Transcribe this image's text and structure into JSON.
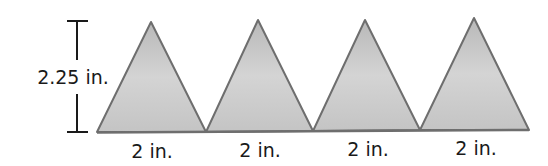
{
  "diagram": {
    "type": "triangle-net",
    "height_label": "2.25 in.",
    "base_labels": [
      "2 in.",
      "2 in.",
      "2 in.",
      "2 in."
    ],
    "fill_color": "#c8c8c8",
    "stroke_color": "#6e6e6e",
    "triangles": [
      {
        "left": 97,
        "apex_x": 151,
        "apex_y": 22,
        "right": 206
      },
      {
        "left": 206,
        "apex_x": 258,
        "apex_y": 20,
        "right": 313
      },
      {
        "left": 313,
        "apex_x": 365,
        "apex_y": 20,
        "right": 420
      },
      {
        "left": 420,
        "apex_x": 474,
        "apex_y": 18,
        "right": 529
      }
    ]
  }
}
